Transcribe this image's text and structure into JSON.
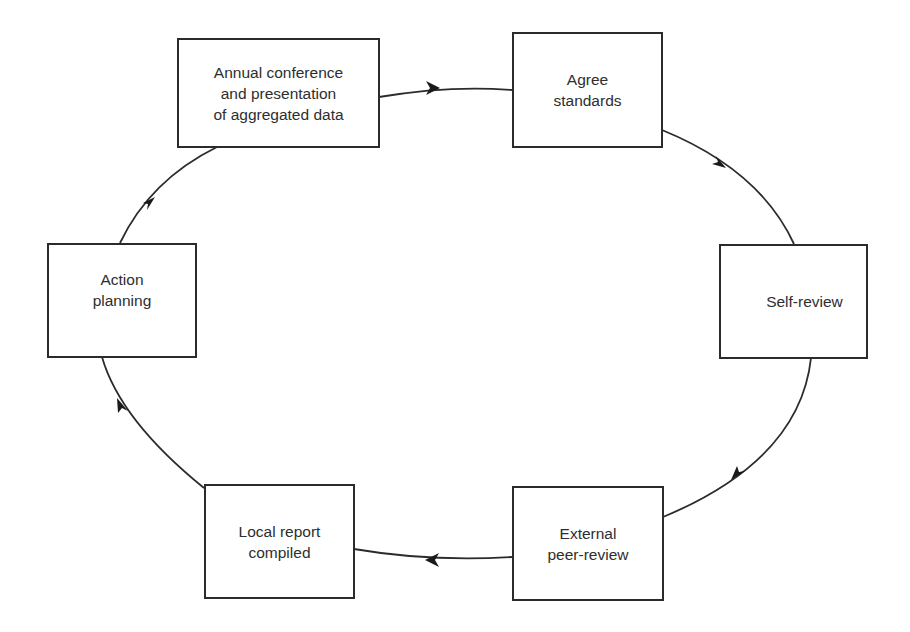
{
  "diagram": {
    "type": "cycle",
    "nodes": [
      {
        "id": "annual",
        "label": "Annual conference\nand presentation\nof aggregated data"
      },
      {
        "id": "agree",
        "label": "Agree\nstandards"
      },
      {
        "id": "self",
        "label": "Self-review"
      },
      {
        "id": "external",
        "label": "External\npeer-review"
      },
      {
        "id": "local",
        "label": "Local report\ncompiled"
      },
      {
        "id": "action",
        "label": "Action\nplanning"
      }
    ],
    "edges": [
      {
        "from": "annual",
        "to": "agree"
      },
      {
        "from": "agree",
        "to": "self"
      },
      {
        "from": "self",
        "to": "external"
      },
      {
        "from": "external",
        "to": "local"
      },
      {
        "from": "local",
        "to": "action"
      },
      {
        "from": "action",
        "to": "annual"
      }
    ],
    "colors": {
      "stroke": "#2b2b2b",
      "background": "#ffffff",
      "text": "#2e2e2e"
    }
  }
}
